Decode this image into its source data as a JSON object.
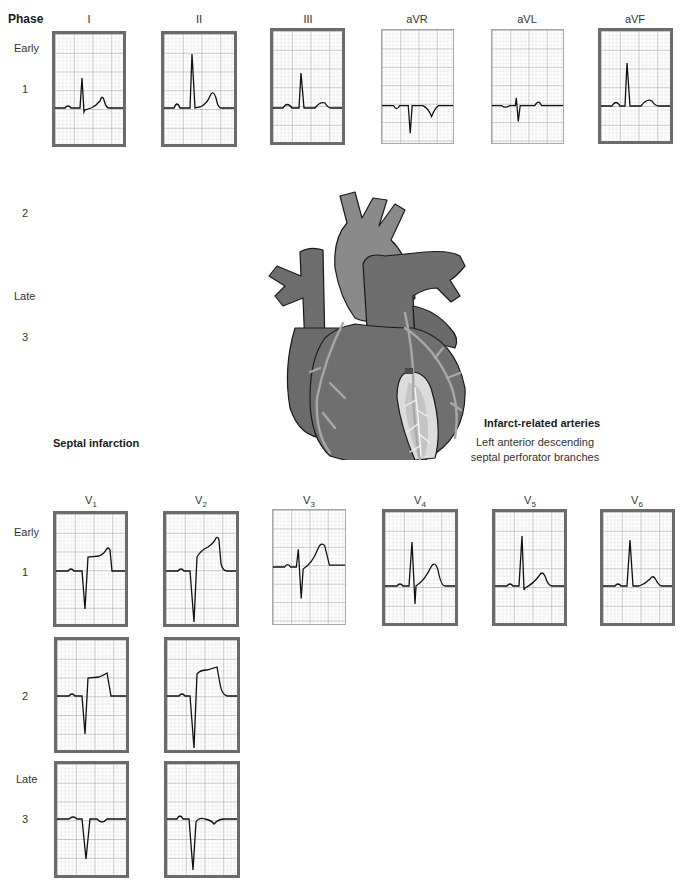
{
  "figure": {
    "phase_header": "Phase",
    "infarction_title": "Septal infarction",
    "arteries": {
      "title": "Infarct-related arteries",
      "line1": "Left anterior descending",
      "line2": "septal perforator branches"
    },
    "heart_illustration": "heart-anterior-view-with-LAD-septal-perforators"
  },
  "limb_leads": {
    "phase_labels": [
      {
        "id": "early",
        "text": "Early"
      },
      {
        "id": "p1",
        "text": "1"
      },
      {
        "id": "p2",
        "text": "2"
      },
      {
        "id": "late",
        "text": "Late"
      },
      {
        "id": "p3",
        "text": "3"
      }
    ],
    "leads": [
      {
        "name": "I",
        "border": "thick"
      },
      {
        "name": "II",
        "border": "thick"
      },
      {
        "name": "III",
        "border": "thick"
      },
      {
        "name": "aVR",
        "border": "thin"
      },
      {
        "name": "aVL",
        "border": "thin"
      },
      {
        "name": "aVF",
        "border": "thick"
      }
    ]
  },
  "precordial_leads": {
    "phase_labels": [
      {
        "id": "early",
        "text": "Early"
      },
      {
        "id": "p1",
        "text": "1"
      },
      {
        "id": "p2",
        "text": "2"
      },
      {
        "id": "late",
        "text": "Late"
      },
      {
        "id": "p3",
        "text": "3"
      }
    ],
    "leads": [
      {
        "name": "V",
        "sub": "1",
        "border": "thick"
      },
      {
        "name": "V",
        "sub": "2",
        "border": "thick"
      },
      {
        "name": "V",
        "sub": "3",
        "border": "thin"
      },
      {
        "name": "V",
        "sub": "4",
        "border": "thick"
      },
      {
        "name": "V",
        "sub": "5",
        "border": "thick"
      },
      {
        "name": "V",
        "sub": "6",
        "border": "thick"
      }
    ]
  },
  "ecg_traces": {
    "I_phase1": "normal upright QRS, small s wave, upright T",
    "II_phase1": "tall upright R, upright T",
    "III_phase1": "upright R, upright T",
    "aVR_phase1": "negative QRS, inverted P and T",
    "aVL_phase1": "small rS, small upright T",
    "aVF_phase1": "upright R, upright T",
    "V1_phase1": "QS complex with ST elevation",
    "V2_phase1": "QS complex with ST elevation",
    "V3_phase1": "rS with upright T",
    "V4_phase1": "RS with upright T",
    "V5_phase1": "tall R with upright T",
    "V6_phase1": "tall R with upright T",
    "V1_phase2": "QS with persistent ST elevation",
    "V2_phase2": "QS with persistent ST elevation",
    "V1_phase3": "QS with inverted T",
    "V2_phase3": "QS with inverted T"
  },
  "colors": {
    "grid_minor": "#c9c9c9",
    "grid_major": "#8c8c8c",
    "panel_border": "#6b6b6b",
    "trace": "#111111",
    "heart_fill": "#7a7a7a",
    "heart_dark": "#5e5e5e",
    "artery": "#a9a9a9",
    "septum": "#d8d8d8"
  }
}
